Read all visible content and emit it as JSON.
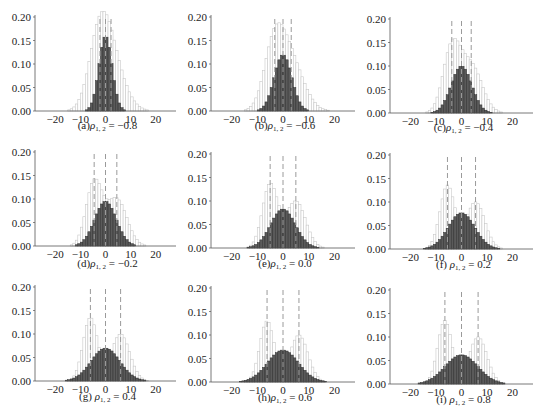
{
  "figure": {
    "panels_layout": {
      "rows": 3,
      "cols": 3
    }
  },
  "chart_data": [
    {
      "id": "a",
      "type": "bar",
      "caption_prefix": "(a)",
      "rho_label": "ρ",
      "rho_sub": "1, 2",
      "rho_value": "−0.8",
      "rho": -0.8,
      "xlim": [
        -28,
        28
      ],
      "xticks": [
        -20,
        -10,
        0,
        10,
        20
      ],
      "ylim": [
        0,
        0.2
      ],
      "yticks": [
        "0.00",
        "0.05",
        "0.10",
        "0.15",
        "0.20"
      ],
      "mixture": {
        "means": [
          -2.2,
          2.2
        ],
        "peaks": [
          0.135,
          0.1
        ],
        "sigma": 4.2
      },
      "sum": {
        "mean": 0,
        "peak": 0.16,
        "sigma": 2.6
      },
      "dashed_lines": [
        -2.2,
        0,
        2.2
      ]
    },
    {
      "id": "b",
      "type": "bar",
      "caption_prefix": "(b)",
      "rho_label": "ρ",
      "rho_sub": "1, 2",
      "rho_value": "−0.6",
      "rho": -0.6,
      "xlim": [
        -28,
        28
      ],
      "xticks": [
        -20,
        -10,
        0,
        10,
        20
      ],
      "ylim": [
        0,
        0.2
      ],
      "yticks": [
        "0.00",
        "0.05",
        "0.10",
        "0.15",
        "0.20"
      ],
      "mixture": {
        "means": [
          -3.2,
          3.2
        ],
        "peaks": [
          0.135,
          0.1
        ],
        "sigma": 4.0
      },
      "sum": {
        "mean": 0,
        "peak": 0.12,
        "sigma": 3.4
      },
      "dashed_lines": [
        -3.2,
        0,
        3.2
      ]
    },
    {
      "id": "c",
      "type": "bar",
      "caption_prefix": "(c)",
      "rho_label": "ρ",
      "rho_sub": "1, 2",
      "rho_value": "−0.4",
      "rho": -0.4,
      "xlim": [
        -28,
        28
      ],
      "xticks": [
        -20,
        -10,
        0,
        10,
        20
      ],
      "ylim": [
        0,
        0.2
      ],
      "yticks": [
        "0.00",
        "0.05",
        "0.10",
        "0.15",
        "0.20"
      ],
      "mixture": {
        "means": [
          -3.8,
          3.8
        ],
        "peaks": [
          0.135,
          0.1
        ],
        "sigma": 3.4
      },
      "sum": {
        "mean": 0,
        "peak": 0.1,
        "sigma": 4.0
      },
      "dashed_lines": [
        -3.8,
        0,
        3.8
      ]
    },
    {
      "id": "d",
      "type": "bar",
      "caption_prefix": "(d)",
      "rho_label": "ρ",
      "rho_sub": "1, 2",
      "rho_value": "−0.2",
      "rho": -0.2,
      "xlim": [
        -28,
        28
      ],
      "xticks": [
        -20,
        -10,
        0,
        10,
        20
      ],
      "ylim": [
        0,
        0.2
      ],
      "yticks": [
        "0.00",
        "0.05",
        "0.10",
        "0.15",
        "0.20"
      ],
      "mixture": {
        "means": [
          -4.5,
          4.5
        ],
        "peaks": [
          0.135,
          0.1
        ],
        "sigma": 3.2
      },
      "sum": {
        "mean": 0,
        "peak": 0.095,
        "sigma": 4.3
      },
      "dashed_lines": [
        -4.5,
        0,
        4.5
      ]
    },
    {
      "id": "e",
      "type": "bar",
      "caption_prefix": "(e)",
      "rho_label": "ρ",
      "rho_sub": "1, 2",
      "rho_value": "0.0",
      "rho": 0.0,
      "xlim": [
        -28,
        28
      ],
      "xticks": [
        -20,
        -10,
        0,
        10,
        20
      ],
      "ylim": [
        0,
        0.2
      ],
      "yticks": [
        "0.00",
        "0.05",
        "0.10",
        "0.15",
        "0.20"
      ],
      "mixture": {
        "means": [
          -5,
          5
        ],
        "peaks": [
          0.135,
          0.1
        ],
        "sigma": 3.0
      },
      "sum": {
        "mean": 0,
        "peak": 0.083,
        "sigma": 4.8
      },
      "dashed_lines": [
        -5,
        0,
        5
      ]
    },
    {
      "id": "f",
      "type": "bar",
      "caption_prefix": "(f) ",
      "rho_label": "ρ",
      "rho_sub": "1, 2",
      "rho_value": "0.2",
      "rho": 0.2,
      "xlim": [
        -28,
        28
      ],
      "xticks": [
        -20,
        -10,
        0,
        10,
        20
      ],
      "ylim": [
        0,
        0.2
      ],
      "yticks": [
        "0.00",
        "0.05",
        "0.10",
        "0.15",
        "0.20"
      ],
      "mixture": {
        "means": [
          -5.5,
          5.5
        ],
        "peaks": [
          0.135,
          0.1
        ],
        "sigma": 2.9
      },
      "sum": {
        "mean": 0,
        "peak": 0.077,
        "sigma": 5.2
      },
      "dashed_lines": [
        -5.5,
        0,
        5.5
      ]
    },
    {
      "id": "g",
      "type": "bar",
      "caption_prefix": "(g) ",
      "rho_label": "ρ",
      "rho_sub": "1, 2",
      "rho_value": "0.4",
      "rho": 0.4,
      "xlim": [
        -28,
        28
      ],
      "xticks": [
        -20,
        -10,
        0,
        10,
        20
      ],
      "ylim": [
        0,
        0.2
      ],
      "yticks": [
        "0.00",
        "0.05",
        "0.10",
        "0.15",
        "0.20"
      ],
      "mixture": {
        "means": [
          -6,
          6
        ],
        "peaks": [
          0.135,
          0.1
        ],
        "sigma": 2.9
      },
      "sum": {
        "mean": 0,
        "peak": 0.07,
        "sigma": 5.7
      },
      "dashed_lines": [
        -6,
        0,
        6
      ]
    },
    {
      "id": "h",
      "type": "bar",
      "caption_prefix": "(h)",
      "rho_label": "ρ",
      "rho_sub": "1, 2",
      "rho_value": "0.6",
      "rho": 0.6,
      "xlim": [
        -28,
        28
      ],
      "xticks": [
        -20,
        -10,
        0,
        10,
        20
      ],
      "ylim": [
        0,
        0.2
      ],
      "yticks": [
        "0.00",
        "0.05",
        "0.10",
        "0.15",
        "0.20"
      ],
      "mixture": {
        "means": [
          -6.2,
          6.2
        ],
        "peaks": [
          0.13,
          0.1
        ],
        "sigma": 2.8
      },
      "sum": {
        "mean": 0,
        "peak": 0.068,
        "sigma": 6.0
      },
      "dashed_lines": [
        -6.2,
        0,
        6.2
      ]
    },
    {
      "id": "i",
      "type": "bar",
      "caption_prefix": "(i) ",
      "rho_label": "ρ",
      "rho_sub": "1, 2",
      "rho_value": "0.8",
      "rho": 0.8,
      "xlim": [
        -28,
        28
      ],
      "xticks": [
        -20,
        -10,
        0,
        10,
        20
      ],
      "ylim": [
        0,
        0.2
      ],
      "yticks": [
        "0.00",
        "0.05",
        "0.10",
        "0.15",
        "0.20"
      ],
      "mixture": {
        "means": [
          -6.5,
          6.5
        ],
        "peaks": [
          0.135,
          0.1
        ],
        "sigma": 2.8
      },
      "sum": {
        "mean": 0,
        "peak": 0.062,
        "sigma": 6.4
      },
      "dashed_lines": [
        -6.5,
        0,
        6.5
      ]
    }
  ],
  "colors": {
    "mixture_bar_stroke": "#c8c8c8",
    "mixture_bar_fill": "#ffffff",
    "sum_bar_fill": "#5a5a5a",
    "sum_bar_stroke": "#2e2e2e",
    "dashed_line": "#9a9a9a",
    "axis": "#555555",
    "text": "#222222"
  },
  "layout": {
    "panels": [
      {
        "axis_x": 35,
        "plot_right": 176,
        "y_top": 17,
        "y_bottom": 111,
        "caption_y": 129
      },
      {
        "axis_x": 211,
        "plot_right": 355,
        "y_top": 17,
        "y_bottom": 111,
        "caption_y": 129
      },
      {
        "axis_x": 390,
        "plot_right": 533,
        "y_top": 19,
        "y_bottom": 113,
        "caption_y": 131
      },
      {
        "axis_x": 35,
        "plot_right": 176,
        "y_top": 152,
        "y_bottom": 246,
        "caption_y": 267
      },
      {
        "axis_x": 211,
        "plot_right": 355,
        "y_top": 154,
        "y_bottom": 248,
        "caption_y": 267
      },
      {
        "axis_x": 390,
        "plot_right": 533,
        "y_top": 155,
        "y_bottom": 249,
        "caption_y": 268
      },
      {
        "axis_x": 35,
        "plot_right": 176,
        "y_top": 287,
        "y_bottom": 381,
        "caption_y": 400
      },
      {
        "axis_x": 211,
        "plot_right": 355,
        "y_top": 288,
        "y_bottom": 382,
        "caption_y": 401
      },
      {
        "axis_x": 390,
        "plot_right": 533,
        "y_top": 290,
        "y_bottom": 384,
        "caption_y": 403
      }
    ],
    "bin_width": 1.0
  }
}
